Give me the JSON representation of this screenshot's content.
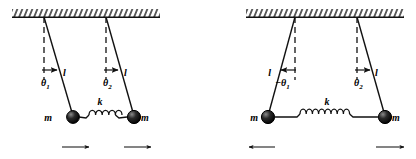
{
  "figure": {
    "type": "physics-diagram",
    "width": 416,
    "height": 159,
    "background_color": "#ffffff",
    "ink_color": "#111111"
  },
  "panels": [
    {
      "id": "left",
      "mode_name": "symmetric",
      "ceiling": {
        "name": "hatched-ceiling",
        "hatch_direction": "right-leaning"
      },
      "pendulums": [
        {
          "id": "p1",
          "angle_label": "θ",
          "angle_subscript": "1",
          "angle_sign": "",
          "length_label": "l",
          "mass_label": "m",
          "tilt": "right",
          "arrow_direction": "right"
        },
        {
          "id": "p2",
          "angle_label": "θ",
          "angle_subscript": "2",
          "angle_sign": "",
          "length_label": "l",
          "mass_label": "m",
          "tilt": "right",
          "arrow_direction": "right"
        }
      ],
      "spring": {
        "label": "k",
        "coils": 5,
        "state": "relaxed"
      },
      "motion_arrows": [
        "right",
        "right"
      ]
    },
    {
      "id": "right",
      "mode_name": "antisymmetric",
      "ceiling": {
        "name": "hatched-ceiling",
        "hatch_direction": "right-leaning"
      },
      "pendulums": [
        {
          "id": "p1",
          "angle_label": "θ",
          "angle_subscript": "1",
          "angle_sign": "−",
          "length_label": "l",
          "mass_label": "m",
          "tilt": "left",
          "arrow_direction": "left"
        },
        {
          "id": "p2",
          "angle_label": "θ",
          "angle_subscript": "2",
          "angle_sign": "",
          "length_label": "l",
          "mass_label": "m",
          "tilt": "right",
          "arrow_direction": "right"
        }
      ],
      "spring": {
        "label": "k",
        "coils": 8,
        "state": "stretched"
      },
      "motion_arrows": [
        "left",
        "right"
      ]
    }
  ]
}
